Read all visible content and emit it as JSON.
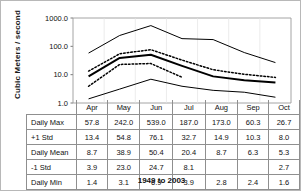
{
  "figure": {
    "ylabel": "Cubic Meters / second",
    "caption": "1949 to 2003"
  },
  "chart_data": {
    "type": "line",
    "title": "",
    "xlabel": "",
    "ylabel": "Cubic Meters / second",
    "caption": "1949 to 2003",
    "scale": "log",
    "ylim": [
      1.0,
      1000.0
    ],
    "yticks": [
      "1.0",
      "10.0",
      "100.0",
      "1000.0"
    ],
    "ytick_values": [
      1.0,
      10.0,
      100.0,
      1000.0
    ],
    "grid": false,
    "legend": "none",
    "categories": [
      "Apr",
      "May",
      "Jun",
      "Jul",
      "Aug",
      "Sep",
      "Oct"
    ],
    "series": [
      {
        "name": "Daily Max",
        "style": "solid-thin",
        "values": [
          57.8,
          242.0,
          539.0,
          187.0,
          173.0,
          60.3,
          26.7
        ]
      },
      {
        "name": "+1 Std",
        "style": "dotted",
        "values": [
          13.4,
          54.8,
          76.1,
          32.7,
          14.9,
          10.3,
          8.0
        ]
      },
      {
        "name": "Daily Mean",
        "style": "solid-thick",
        "values": [
          8.7,
          38.9,
          50.4,
          20.4,
          8.7,
          6.3,
          5.3
        ]
      },
      {
        "name": "-1 Std",
        "style": "dotted",
        "values": [
          3.9,
          23.0,
          24.7,
          8.1,
          null,
          null,
          2.7
        ]
      },
      {
        "name": "Daily Min",
        "style": "solid-thin",
        "values": [
          1.4,
          3.1,
          6.9,
          3.9,
          2.8,
          2.4,
          1.6
        ]
      }
    ]
  },
  "table": {
    "columns": [
      "Apr",
      "May",
      "Jun",
      "Jul",
      "Aug",
      "Sep",
      "Oct"
    ],
    "rows": [
      {
        "label": "Daily Max",
        "values": [
          "57.8",
          "242.0",
          "539.0",
          "187.0",
          "173.0",
          "60.3",
          "26.7"
        ]
      },
      {
        "label": "+1 Std",
        "values": [
          "13.4",
          "54.8",
          "76.1",
          "32.7",
          "14.9",
          "10.3",
          "8.0"
        ]
      },
      {
        "label": "Daily Mean",
        "values": [
          "8.7",
          "38.9",
          "50.4",
          "20.4",
          "8.7",
          "6.3",
          "5.3"
        ]
      },
      {
        "label": "-1 Std",
        "values": [
          "3.9",
          "23.0",
          "24.7",
          "8.1",
          "",
          "",
          "2.7"
        ]
      },
      {
        "label": "Daily Min",
        "values": [
          "1.4",
          "3.1",
          "6.9",
          "3.9",
          "2.8",
          "2.4",
          "1.6"
        ]
      }
    ]
  }
}
